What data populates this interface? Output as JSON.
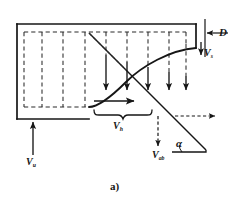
{
  "figure": {
    "caption": "a)",
    "labels": {
      "depth": "D",
      "settling_velocity": "V",
      "settling_velocity_sub": "s",
      "horizontal_velocity": "V",
      "horizontal_velocity_sub": "h",
      "absolute_velocity": "V",
      "absolute_velocity_sub": "ab",
      "upflow_velocity": "V",
      "upflow_velocity_sub": "u",
      "angle": "α"
    },
    "colors": {
      "line": "#161616",
      "dashed": "#2a2a2a",
      "background": "#ffffff"
    },
    "icon_names": [
      "down-arrow-icon",
      "right-arrow-icon",
      "up-arrow-icon",
      "brace-icon",
      "dimension-arrow-icon"
    ]
  }
}
